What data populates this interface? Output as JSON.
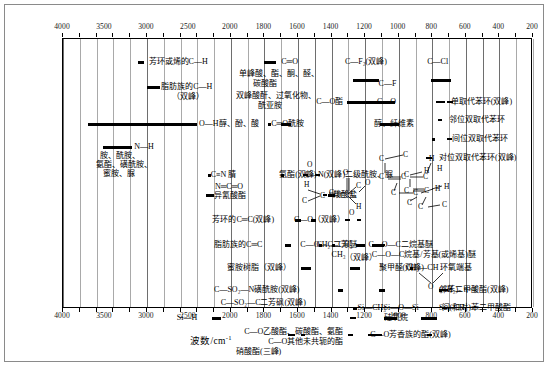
{
  "figure": {
    "axis_title": "波数/cm",
    "axis_title_sup": "-1"
  },
  "chart_data": {
    "type": "table",
    "xlabel": "波数/cm^-1",
    "ylabel": "",
    "xlim": [
      4000,
      200
    ],
    "axis_direction": "decreasing",
    "grid": true,
    "legend_position": "none",
    "axis_ticks_top": [
      4000,
      3500,
      3000,
      2500,
      2000,
      1800,
      1600,
      1400,
      1200,
      1000,
      800,
      600,
      400,
      200
    ],
    "axis_ticks_bottom": [
      4000,
      3500,
      3000,
      2500,
      2000,
      1800,
      1600,
      1400,
      1200,
      1000,
      800,
      600,
      400,
      200
    ],
    "gridline_values": [
      4000,
      3800,
      3600,
      3400,
      3200,
      3000,
      2800,
      2600,
      2400,
      2200,
      2000,
      1900,
      1800,
      1700,
      1600,
      1500,
      1400,
      1300,
      1200,
      1100,
      1000,
      900,
      800,
      700,
      600,
      500,
      400,
      300,
      200
    ],
    "bands": [
      {
        "label": "芳环或烯的C—H",
        "from": 3100,
        "to": 3000,
        "row": 0
      },
      {
        "label": "脂肪族的C—H",
        "label2": "（双峰）",
        "from": 2980,
        "to": 2850,
        "row": 1
      },
      {
        "label": "O—H醇、酚、酸",
        "from": 3650,
        "to": 2400,
        "row": 2
      },
      {
        "label": "N—H",
        "label2": "胺、酰胺、",
        "label3": "氨酯、磺酰胺、",
        "label4": "蜜胺、脲",
        "from": 3500,
        "to": 3150,
        "row": 3
      },
      {
        "label": "C≡N 腈",
        "from": 2260,
        "to": 2220,
        "row": 4
      },
      {
        "label": "N═C═O",
        "label2": "异氰酸酯",
        "from": 2290,
        "to": 2230,
        "row": 5
      },
      {
        "label": "芳环的C═C(双峰)",
        "from": 1620,
        "to": 1580,
        "row": 6
      },
      {
        "label": "脂肪族的C═C",
        "from": 1680,
        "to": 1630,
        "row": 7
      },
      {
        "label": "蜜胺树脂（双峰）",
        "from": 1580,
        "to": 1520,
        "row": 8
      },
      {
        "label": "C—SO₂—N磺酰胺(双峰)",
        "from": 1380,
        "to": 1320,
        "row": 9
      },
      {
        "label": "C—SO₂—C二芳砜(双峰)",
        "from": 1340,
        "to": 1290,
        "row": 10
      },
      {
        "label": "Si—H",
        "from": 2250,
        "to": 2100,
        "row": 11
      },
      {
        "label": "C—O乙酸酯、碳酸酯、氨酯",
        "from": 1280,
        "to": 1210,
        "row": 12
      },
      {
        "label": "C—O其他未共轭的酯",
        "from": 1250,
        "to": 1180,
        "row": 13
      },
      {
        "label": "硝酸酯(三峰)",
        "from": 1650,
        "to": 1620,
        "row": 14
      },
      {
        "label": "C═O",
        "label2": "单峰酸、酯、酮、醛、",
        "label3": "碳酸酯",
        "label4": "双峰酸酐、过氧化物、",
        "label5": "酰亚胺",
        "from": 1800,
        "to": 1700,
        "row": 15
      },
      {
        "label": "C═O酰胺",
        "from": 1700,
        "to": 1630,
        "row": 16
      },
      {
        "label": "C—F₂(双峰)",
        "from": 1250,
        "to": 1120,
        "row": 17
      },
      {
        "label": "C—O酯",
        "from": 1300,
        "to": 1150,
        "row": 18
      },
      {
        "label": "C—F",
        "from": 1150,
        "to": 1050,
        "row": 19
      },
      {
        "label": "C—O",
        "label2": "醇、纤维素",
        "from": 1100,
        "to": 1000,
        "row": 20
      },
      {
        "label": "C—Cl",
        "from": 800,
        "to": 700,
        "row": 21
      },
      {
        "label": "单取代苯环(双峰)",
        "from": 770,
        "to": 690,
        "row": 22
      },
      {
        "label": "邻位双取代苯环",
        "from": 760,
        "to": 740,
        "row": 23
      },
      {
        "label": "间位双取代苯环",
        "from": 790,
        "to": 690,
        "row": 24
      },
      {
        "label": "对位双取代苯环(双峰)",
        "from": 840,
        "to": 800,
        "row": 25
      },
      {
        "label": "C—N(双峰)二级酰胺、脲",
        "from": 1560,
        "to": 1520,
        "row": 26
      },
      {
        "label": "氨酯(双峰)",
        "from": 1540,
        "to": 1450,
        "row": 27
      },
      {
        "label": "羧酸盐",
        "from": 1420,
        "to": 1370,
        "row": 28
      },
      {
        "label": "C—O（双峰）",
        "from": 1300,
        "to": 1230,
        "row": 29
      },
      {
        "label": "C—O—C二芳醚",
        "from": 1250,
        "to": 1190,
        "row": 30
      },
      {
        "label": "C—O—C二烷基醚",
        "from": 1150,
        "to": 1060,
        "row": 31
      },
      {
        "label": "C—O—C烷基/芳基(或烯基)醚",
        "from": 1270,
        "to": 1200,
        "row": 32
      },
      {
        "label": "聚甲醛(双峰)",
        "from": 1120,
        "to": 1080,
        "row": 33
      },
      {
        "label": "CH₂—CH 环氧端基",
        "from": 950,
        "to": 830,
        "row": 34
      },
      {
        "label": "(CH₂)ₙ n>4",
        "from": 740,
        "to": 720,
        "row": 35
      },
      {
        "label": "邻苯二甲酸酯(双峰)",
        "from": 750,
        "to": 700,
        "row": 36
      },
      {
        "label": "间(和对)苯二甲酸酯",
        "from": 740,
        "to": 720,
        "row": 37
      },
      {
        "label": "Si—CH₃",
        "from": 1270,
        "to": 1250,
        "row": 38
      },
      {
        "label": "Si—O—Si",
        "label2": "硅氧烷",
        "from": 1100,
        "to": 1000,
        "row": 39
      },
      {
        "label": "Si—CH₃",
        "from": 850,
        "to": 750,
        "row": 40
      },
      {
        "label": "C—O芳香族的酯(双峰)",
        "from": 1180,
        "to": 1100,
        "row": 41
      },
      {
        "label": "CH₂—CH₃",
        "from": 1470,
        "to": 1440,
        "row": 42
      },
      {
        "label": "CH₃",
        "from": 1390,
        "to": 1370,
        "row": 43
      }
    ]
  },
  "axis": {
    "top_labels": [
      "4000",
      "3500",
      "3000",
      "2500",
      "2000",
      "1800",
      "1600",
      "1400",
      "1200",
      "1000",
      "800",
      "600",
      "400",
      "200"
    ],
    "bottom_labels": [
      "4000",
      "3500",
      "3000",
      "2500",
      "2000",
      "1800",
      "1600",
      "1400",
      "1200",
      "1000",
      "800",
      "600",
      "400",
      "200"
    ]
  },
  "labels": {
    "l01": "芳环或烯的C—H",
    "l02": "脂肪族的C—H",
    "l03": "（双峰）",
    "l04": "O—H醇、酚、酸",
    "l05": "N—H",
    "l06": "胺、酰胺、",
    "l07": "氨酯、磺酰胺、",
    "l08": "蜜胺、脲",
    "l09": "C≡N 腈",
    "l10": "N═C═O",
    "l11": "异氰酸酯",
    "l12": "芳环的C═C(双峰)",
    "l13": "脂肪族的C═C",
    "l14": "蜜胺树脂（双峰）",
    "l15": "C—SO₂—N磺酰胺(双峰)",
    "l16": "C—SO₂—C二芳砜(双峰)",
    "l17": "Si—H",
    "l18": "C—O乙酸酯、碳酸酯、氨酯",
    "l19": "C—O其他未共轭的酯",
    "l20": "硝酸酯(三峰)",
    "l21": "C═O",
    "l22": "单峰酸、酯、酮、醛、",
    "l23": "碳酸酯",
    "l24": "双峰酸酐、过氧化物、",
    "l25": "酰亚胺",
    "l26": "C═O酰胺",
    "l27": "C—F₂(双峰)",
    "l28": "C—O酯",
    "l29": "C—F",
    "l30": "C—O",
    "l31": "醇、纤维素",
    "l32": "C—Cl",
    "l33": "单取代苯环(双峰)",
    "l34": "邻位双取代苯环",
    "l35": "间位双取代苯环",
    "l36": "对位双取代苯环(双峰)",
    "l37": "C—N(双峰)二级酰胺、脲",
    "l38": "氨酯(双峰)",
    "l39": "羧酸盐",
    "l40": "C—O（双峰）",
    "l41": "C—O—C二芳醚",
    "l42": "C—O—C二烷基醚",
    "l43": "C—O—C烷基/芳基(或烯基)醚",
    "l44": "聚甲醛(双峰)",
    "l45": "CH₂—CH 环氧端基",
    "l46": "(CH₂)ₙ n>4",
    "l47": "邻苯二甲酸酯(双峰)",
    "l48": "间(和对)苯二甲酸酯",
    "l49": "Si—CH₃",
    "l50": "Si—O—Si",
    "l51": "硅氧烷",
    "l52": "Si—CH₃",
    "l53": "C—O芳香族的酯(双峰)",
    "l54": "CH₂—CH₃",
    "l55": "CH₃",
    "l56": "O",
    "l57": "H",
    "l58": "C",
    "l59": "（双峰）"
  }
}
